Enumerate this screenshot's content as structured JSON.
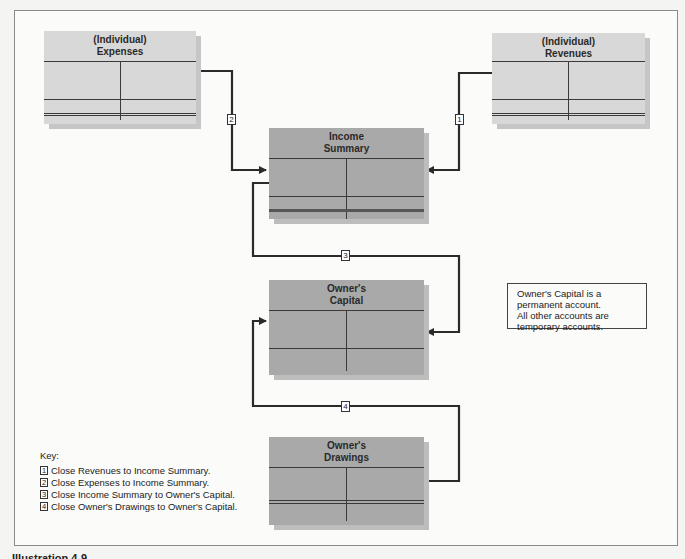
{
  "diagram": {
    "accounts": {
      "expenses": {
        "line1": "(Individual)",
        "line2": "Expenses"
      },
      "revenues": {
        "line1": "(Individual)",
        "line2": "Revenues"
      },
      "income_summary": {
        "line1": "Income",
        "line2": "Summary"
      },
      "owners_capital": {
        "line1": "Owner's",
        "line2": "Capital"
      },
      "owners_drawings": {
        "line1": "Owner's",
        "line2": "Drawings"
      }
    },
    "steps": {
      "s1": "1",
      "s2": "2",
      "s3": "3",
      "s4": "4"
    },
    "note": {
      "line1": "Owner's Capital is a",
      "line2": "permanent account.",
      "line3": "All other accounts are",
      "line4": "temporary accounts."
    },
    "key": {
      "title": "Key:",
      "items": [
        {
          "num": "1",
          "text": "Close Revenues to Income Summary."
        },
        {
          "num": "2",
          "text": "Close Expenses to Income Summary."
        },
        {
          "num": "3",
          "text": "Close Income Summary to Owner's Capital."
        },
        {
          "num": "4",
          "text": "Close Owner's Drawings to Owner's Capital."
        }
      ]
    },
    "background_ghost_text": "Preparing Closing Entries",
    "caption": "Illustration 4-9",
    "colors": {
      "temporary_light": "#d8d8d8",
      "account_dark": "#a9a9a9",
      "line": "#2a2a2a"
    }
  }
}
